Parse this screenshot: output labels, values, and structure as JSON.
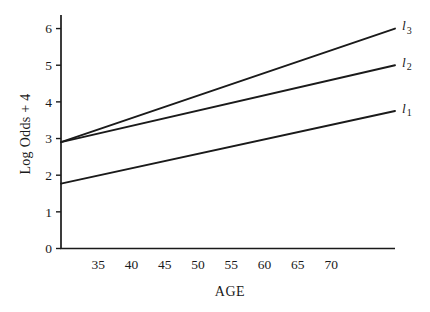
{
  "figure": {
    "background": "#ffffff",
    "ink_color": "#1a1a1a"
  },
  "chart_data": {
    "type": "line",
    "title": "",
    "xlabel": "AGE",
    "ylabel": "Log Odds + 4",
    "xlim": [
      29.4,
      79.6
    ],
    "ylim": [
      0,
      6.37
    ],
    "x_ticks": [
      35,
      40,
      45,
      50,
      55,
      60,
      65,
      70
    ],
    "y_ticks": [
      0,
      1,
      2,
      3,
      4,
      5,
      6
    ],
    "grid": false,
    "legend_position": "right-end-of-line",
    "series": [
      {
        "name": "l1",
        "label_base": "l",
        "label_sub": "1",
        "points": [
          [
            29.4,
            1.77
          ],
          [
            79.6,
            3.75
          ]
        ]
      },
      {
        "name": "l2",
        "label_base": "l",
        "label_sub": "2",
        "points": [
          [
            29.4,
            2.9
          ],
          [
            79.6,
            5.0
          ]
        ]
      },
      {
        "name": "l3",
        "label_base": "l",
        "label_sub": "3",
        "points": [
          [
            29.4,
            2.9
          ],
          [
            79.6,
            6.0
          ]
        ]
      }
    ]
  }
}
